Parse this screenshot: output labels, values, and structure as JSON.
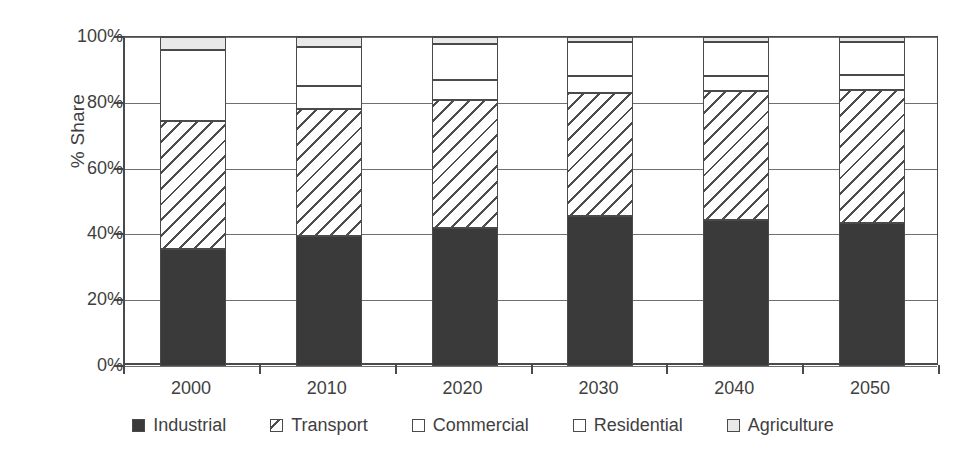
{
  "chart_data": {
    "type": "bar",
    "subtype": "stacked-bar-100-percent",
    "title": "",
    "xlabel": "",
    "ylabel": "% Share",
    "ylim": [
      0,
      100
    ],
    "ytick_labels": [
      "0%",
      "20%",
      "40%",
      "60%",
      "80%",
      "100%"
    ],
    "ytick_values": [
      0,
      20,
      40,
      60,
      80,
      100
    ],
    "grid": true,
    "legend_position": "bottom",
    "categories": [
      "2000",
      "2010",
      "2020",
      "2030",
      "2040",
      "2050"
    ],
    "series": [
      {
        "name": "Industrial",
        "pattern": "solid-dark",
        "color": "#3a3a3a",
        "values": [
          35.5,
          39.5,
          42.0,
          45.5,
          44.5,
          43.5
        ]
      },
      {
        "name": "Transport",
        "pattern": "diagonal-hatch",
        "color": "#ffffff",
        "values": [
          39.0,
          38.5,
          39.0,
          37.5,
          39.0,
          40.5
        ]
      },
      {
        "name": "Commercial",
        "pattern": "empty",
        "color": "#ffffff",
        "values": [
          21.5,
          7.0,
          6.0,
          5.0,
          4.5,
          4.5
        ]
      },
      {
        "name": "Residential",
        "pattern": "empty",
        "color": "#ffffff",
        "values": [
          0.0,
          12.0,
          11.0,
          10.5,
          10.5,
          10.0
        ]
      },
      {
        "name": "Agriculture",
        "pattern": "light-gray",
        "color": "#e9e9e9",
        "values": [
          4.0,
          3.0,
          2.0,
          1.5,
          1.5,
          1.5
        ]
      }
    ],
    "cumulative_tops": [
      {
        "category": "2000",
        "tops": [
          35.5,
          74.5,
          96.0,
          96.0,
          100.0
        ]
      },
      {
        "category": "2010",
        "tops": [
          39.5,
          78.0,
          85.0,
          97.0,
          100.0
        ]
      },
      {
        "category": "2020",
        "tops": [
          42.0,
          81.0,
          87.0,
          98.0,
          100.0
        ]
      },
      {
        "category": "2030",
        "tops": [
          45.5,
          83.0,
          88.0,
          98.5,
          100.0
        ]
      },
      {
        "category": "2040",
        "tops": [
          44.5,
          83.5,
          88.0,
          98.5,
          100.0
        ]
      },
      {
        "category": "2050",
        "tops": [
          43.5,
          84.0,
          88.5,
          98.5,
          100.0
        ]
      }
    ]
  },
  "legend": {
    "items": [
      {
        "label": "Industrial",
        "swatch": "legend-swatch-industrial"
      },
      {
        "label": "Transport",
        "swatch": "legend-swatch-transport"
      },
      {
        "label": "Commercial",
        "swatch": "legend-swatch-commercial"
      },
      {
        "label": "Residential",
        "swatch": "legend-swatch-residential"
      },
      {
        "label": "Agriculture",
        "swatch": "legend-swatch-agriculture"
      }
    ]
  }
}
